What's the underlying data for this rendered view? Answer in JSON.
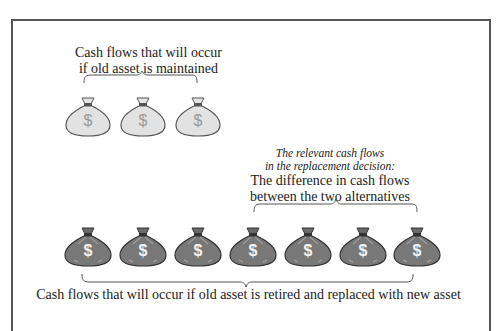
{
  "top_group": {
    "label_line1": "Cash flows that will occur",
    "label_line2": "if old asset is maintained",
    "bag_count": 3,
    "bag_color": "#dcdcdc"
  },
  "relevant": {
    "italic_line1": "The relevant cash flows",
    "italic_line2": "in the replacement decision:",
    "line1": "The difference in cash flows",
    "line2": "between the two alternatives",
    "bag_count": 4
  },
  "bottom_group": {
    "label": "Cash flows that will occur if old asset is retired and replaced with new asset",
    "bag_count": 7,
    "bag_color": "#7a7a7a"
  },
  "bag_symbol": "$"
}
